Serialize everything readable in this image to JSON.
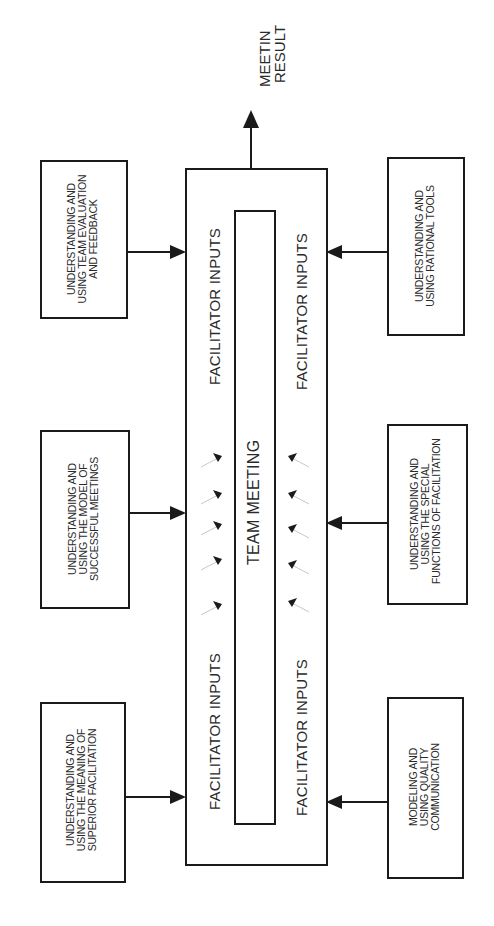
{
  "diagram": {
    "center": {
      "outer_label": "",
      "inner_label": "TEAM MEETING",
      "facilitator_labels": [
        "FACILITATOR INPUTS",
        "FACILITATOR INPUTS",
        "FACILITATOR INPUTS",
        "FACILITATOR INPUTS"
      ]
    },
    "output": {
      "lines": [
        "MEETIN",
        "RESULT"
      ]
    },
    "left_inputs": [
      {
        "lines": [
          "UNDERSTANDING AND",
          "USING TEAM EVALUATION",
          "AND FEEDBACK"
        ]
      },
      {
        "lines": [
          "UNDERSTANDING AND",
          "USING THE MODEL OF",
          "SUCCESSFUL MEETINGS"
        ]
      },
      {
        "lines": [
          "UNDERSTANDING AND",
          "USING THE MEANING OF",
          "SUPERIOR FACILITATION"
        ]
      }
    ],
    "right_inputs": [
      {
        "lines": [
          "UNDERSTANDING AND",
          "USING RATIONAL TOOLS"
        ]
      },
      {
        "lines": [
          "UNDERSTANDING AND",
          "USING THE SPECIAL",
          "FUNCTIONS OF FACILITATION"
        ]
      },
      {
        "lines": [
          "MODELING AND",
          "USING QUALITY",
          "COMMUNICATION"
        ]
      }
    ],
    "colors": {
      "line": "#1a1a1a",
      "faint_arrow": "#c8c8c8"
    }
  }
}
